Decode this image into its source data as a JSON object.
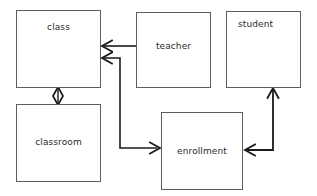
{
  "diagram": {
    "kind": "uml-class-diagram",
    "width": 317,
    "height": 196,
    "background_color": "#ffffff",
    "stroke_color": "#5d5d5d",
    "connector_color": "#1a1a1a",
    "text_color": "#2b2b2b",
    "entities": [
      {
        "id": "class",
        "label": "class",
        "x": 16,
        "y": 10,
        "w": 85,
        "h": 78,
        "label_x": 58,
        "label_y": 25,
        "label_align": "top"
      },
      {
        "id": "teacher",
        "label": "teacher",
        "x": 136,
        "y": 12,
        "w": 75,
        "h": 76,
        "label_x": 173,
        "label_y": 45,
        "label_align": "mid"
      },
      {
        "id": "student",
        "label": "student",
        "x": 226,
        "y": 11,
        "w": 75,
        "h": 77,
        "label_x": 254,
        "label_y": 23,
        "label_align": "topleft"
      },
      {
        "id": "classroom",
        "label": "classroom",
        "x": 16,
        "y": 104,
        "w": 85,
        "h": 78,
        "label_x": 58,
        "label_y": 141,
        "label_align": "mid"
      },
      {
        "id": "enrollment",
        "label": "enrollment",
        "x": 161,
        "y": 112,
        "w": 82,
        "h": 78,
        "label_x": 202,
        "label_y": 151,
        "label_align": "mid"
      }
    ],
    "connectors": [
      {
        "id": "teacher-to-class",
        "from": "teacher",
        "to": "class",
        "type": "association-directed",
        "arrowhead": "open-left",
        "path": "M 136 46 L 103 46"
      },
      {
        "id": "class-to-enrollment",
        "from": "class",
        "to": "enrollment",
        "type": "association-directed",
        "arrowhead": "open-right",
        "path": "M 103 58 L 120 58 L 120 148 L 158 148"
      },
      {
        "id": "class-aggregates-classroom",
        "from": "class",
        "to": "classroom",
        "type": "aggregation",
        "arrowhead": "hollow-diamond",
        "path": "M 58 88 L 58 104",
        "diamond_cx": 58,
        "diamond_cy": 96,
        "diamond_rx": 5,
        "diamond_ry": 9
      },
      {
        "id": "student-to-enrollment",
        "from": "student",
        "to": "enrollment",
        "type": "association-directed",
        "arrowhead": "open-left",
        "path": "M 273 88 L 273 150 L 246 150"
      },
      {
        "id": "enrollment-to-student",
        "from": "enrollment",
        "to": "student",
        "type": "association-directed",
        "arrowhead": "open-up",
        "path": "M 246 150 L 273 150 L 273 90"
      }
    ]
  }
}
